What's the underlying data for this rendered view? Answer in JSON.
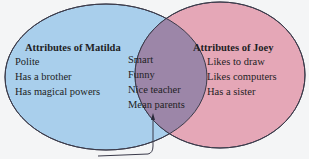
{
  "diagram": {
    "type": "venn",
    "sets": [
      {
        "id": "matilda",
        "title": "Attributes of Matilda",
        "color": "#a9cfec",
        "items": [
          "Polite",
          "Has a brother",
          "Has magical powers"
        ]
      },
      {
        "id": "joey",
        "title": "Attributes of Joey",
        "color": "#e5a7b7",
        "items": [
          "Likes to draw",
          "Likes computers",
          "Has a sister"
        ]
      }
    ],
    "intersection": {
      "color": "#9c86a8",
      "items": [
        "Smart",
        "Funny",
        "Nice teacher",
        "Mean parents"
      ]
    },
    "outline_color": "#3a3a4a",
    "arrow": {
      "points_to": "intersection"
    }
  }
}
